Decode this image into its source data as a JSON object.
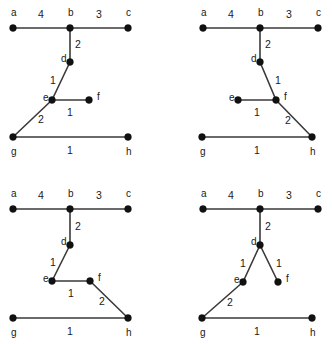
{
  "figure": {
    "width": 332,
    "height": 344,
    "background_color": "#ffffff",
    "node_color": "#111111",
    "edge_color": "#3a3a3a",
    "label_color": "#1a1a1a",
    "node_radius": 3.4,
    "panel_count": 4
  },
  "panels": [
    {
      "name": "panel-top-left",
      "nodes": [
        {
          "id": "a",
          "label": "a",
          "x": 13,
          "y": 28,
          "label_x": 11,
          "label_y": 13
        },
        {
          "id": "b",
          "label": "b",
          "x": 70,
          "y": 28,
          "label_x": 68,
          "label_y": 13
        },
        {
          "id": "c",
          "label": "c",
          "x": 128,
          "y": 28,
          "label_x": 126,
          "label_y": 13
        },
        {
          "id": "d",
          "label": "d",
          "x": 70,
          "y": 62,
          "label_x": 61,
          "label_y": 59
        },
        {
          "id": "e",
          "label": "e",
          "x": 52,
          "y": 100,
          "label_x": 43,
          "label_y": 98
        },
        {
          "id": "f",
          "label": "f",
          "x": 89,
          "y": 100,
          "label_x": 97,
          "label_y": 97
        },
        {
          "id": "g",
          "label": "g",
          "x": 13,
          "y": 137,
          "label_x": 11,
          "label_y": 152
        },
        {
          "id": "h",
          "label": "h",
          "x": 128,
          "y": 137,
          "label_x": 126,
          "label_y": 152
        }
      ],
      "edges": [
        {
          "from": "a",
          "to": "b",
          "weight": "4",
          "label_x": 41,
          "label_y": 15
        },
        {
          "from": "b",
          "to": "c",
          "weight": "3",
          "label_x": 99,
          "label_y": 15
        },
        {
          "from": "b",
          "to": "d",
          "weight": "2",
          "label_x": 78,
          "label_y": 45
        },
        {
          "from": "d",
          "to": "e",
          "weight": "1",
          "label_x": 53,
          "label_y": 81
        },
        {
          "from": "e",
          "to": "f",
          "weight": "1",
          "label_x": 70,
          "label_y": 113
        },
        {
          "from": "e",
          "to": "g",
          "weight": "2",
          "label_x": 41,
          "label_y": 120
        },
        {
          "from": "g",
          "to": "h",
          "weight": "1",
          "label_x": 70,
          "label_y": 151
        }
      ]
    },
    {
      "name": "panel-top-right",
      "nodes": [
        {
          "id": "a",
          "label": "a",
          "x": 203,
          "y": 28,
          "label_x": 201,
          "label_y": 13
        },
        {
          "id": "b",
          "label": "b",
          "x": 260,
          "y": 28,
          "label_x": 258,
          "label_y": 13
        },
        {
          "id": "c",
          "label": "c",
          "x": 318,
          "y": 28,
          "label_x": 316,
          "label_y": 13
        },
        {
          "id": "d",
          "label": "d",
          "x": 260,
          "y": 62,
          "label_x": 251,
          "label_y": 59
        },
        {
          "id": "e",
          "label": "e",
          "x": 238,
          "y": 100,
          "label_x": 229,
          "label_y": 98
        },
        {
          "id": "f",
          "label": "f",
          "x": 276,
          "y": 100,
          "label_x": 284,
          "label_y": 97
        },
        {
          "id": "g",
          "label": "g",
          "x": 202,
          "y": 137,
          "label_x": 200,
          "label_y": 152
        },
        {
          "id": "h",
          "label": "h",
          "x": 312,
          "y": 137,
          "label_x": 310,
          "label_y": 152
        }
      ],
      "edges": [
        {
          "from": "a",
          "to": "b",
          "weight": "4",
          "label_x": 231,
          "label_y": 15
        },
        {
          "from": "b",
          "to": "c",
          "weight": "3",
          "label_x": 289,
          "label_y": 15
        },
        {
          "from": "b",
          "to": "d",
          "weight": "2",
          "label_x": 268,
          "label_y": 45
        },
        {
          "from": "d",
          "to": "f",
          "weight": "1",
          "label_x": 278,
          "label_y": 81
        },
        {
          "from": "e",
          "to": "f",
          "weight": "1",
          "label_x": 257,
          "label_y": 113
        },
        {
          "from": "f",
          "to": "h",
          "weight": "2",
          "label_x": 288,
          "label_y": 121
        },
        {
          "from": "g",
          "to": "h",
          "weight": "1",
          "label_x": 257,
          "label_y": 151
        }
      ]
    },
    {
      "name": "panel-bottom-left",
      "nodes": [
        {
          "id": "a",
          "label": "a",
          "x": 13,
          "y": 209,
          "label_x": 11,
          "label_y": 194
        },
        {
          "id": "b",
          "label": "b",
          "x": 70,
          "y": 209,
          "label_x": 68,
          "label_y": 194
        },
        {
          "id": "c",
          "label": "c",
          "x": 128,
          "y": 209,
          "label_x": 126,
          "label_y": 194
        },
        {
          "id": "d",
          "label": "d",
          "x": 70,
          "y": 245,
          "label_x": 61,
          "label_y": 242
        },
        {
          "id": "e",
          "label": "e",
          "x": 52,
          "y": 281,
          "label_x": 43,
          "label_y": 279
        },
        {
          "id": "f",
          "label": "f",
          "x": 90,
          "y": 281,
          "label_x": 98,
          "label_y": 278
        },
        {
          "id": "g",
          "label": "g",
          "x": 13,
          "y": 318,
          "label_x": 11,
          "label_y": 333
        },
        {
          "id": "h",
          "label": "h",
          "x": 128,
          "y": 318,
          "label_x": 126,
          "label_y": 333
        }
      ],
      "edges": [
        {
          "from": "a",
          "to": "b",
          "weight": "4",
          "label_x": 41,
          "label_y": 196
        },
        {
          "from": "b",
          "to": "c",
          "weight": "3",
          "label_x": 99,
          "label_y": 196
        },
        {
          "from": "b",
          "to": "d",
          "weight": "2",
          "label_x": 78,
          "label_y": 227
        },
        {
          "from": "d",
          "to": "e",
          "weight": "1",
          "label_x": 53,
          "label_y": 263
        },
        {
          "from": "e",
          "to": "f",
          "weight": "1",
          "label_x": 71,
          "label_y": 294
        },
        {
          "from": "f",
          "to": "h",
          "weight": "2",
          "label_x": 102,
          "label_y": 302
        },
        {
          "from": "g",
          "to": "h",
          "weight": "1",
          "label_x": 70,
          "label_y": 332
        }
      ]
    },
    {
      "name": "panel-bottom-right",
      "nodes": [
        {
          "id": "a",
          "label": "a",
          "x": 203,
          "y": 209,
          "label_x": 201,
          "label_y": 194
        },
        {
          "id": "b",
          "label": "b",
          "x": 260,
          "y": 209,
          "label_x": 258,
          "label_y": 194
        },
        {
          "id": "c",
          "label": "c",
          "x": 318,
          "y": 209,
          "label_x": 316,
          "label_y": 194
        },
        {
          "id": "d",
          "label": "d",
          "x": 260,
          "y": 245,
          "label_x": 251,
          "label_y": 242
        },
        {
          "id": "e",
          "label": "e",
          "x": 243,
          "y": 282,
          "label_x": 234,
          "label_y": 280
        },
        {
          "id": "f",
          "label": "f",
          "x": 278,
          "y": 282,
          "label_x": 286,
          "label_y": 279
        },
        {
          "id": "g",
          "label": "g",
          "x": 202,
          "y": 318,
          "label_x": 200,
          "label_y": 333
        },
        {
          "id": "h",
          "label": "h",
          "x": 312,
          "y": 318,
          "label_x": 310,
          "label_y": 333
        }
      ],
      "edges": [
        {
          "from": "a",
          "to": "b",
          "weight": "4",
          "label_x": 231,
          "label_y": 196
        },
        {
          "from": "b",
          "to": "c",
          "weight": "3",
          "label_x": 289,
          "label_y": 196
        },
        {
          "from": "b",
          "to": "d",
          "weight": "2",
          "label_x": 268,
          "label_y": 227
        },
        {
          "from": "d",
          "to": "e",
          "weight": "1",
          "label_x": 243,
          "label_y": 264
        },
        {
          "from": "d",
          "to": "f",
          "weight": "1",
          "label_x": 279,
          "label_y": 264
        },
        {
          "from": "e",
          "to": "g",
          "weight": "2",
          "label_x": 230,
          "label_y": 303
        },
        {
          "from": "g",
          "to": "h",
          "weight": "1",
          "label_x": 257,
          "label_y": 332
        }
      ]
    }
  ]
}
